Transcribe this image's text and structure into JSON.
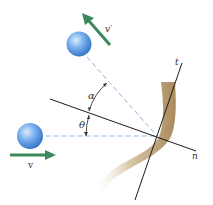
{
  "diagram": {
    "labels": {
      "incoming_velocity": "v",
      "outgoing_velocity": "v′",
      "normal_axis": "n",
      "tangent_axis": "t",
      "angle_rebound": "α",
      "angle_incidence": "θ"
    },
    "colors": {
      "ball_light": "#cfe4fa",
      "ball_mid": "#6aa6ea",
      "ball_dark": "#2f6fc4",
      "arrow": "#3a8a5c",
      "wall_light": "#f1e6d4",
      "wall_dark": "#a88a5c",
      "axis_line": "#1a1a1a",
      "dashed_line": "#8fb4dc",
      "label": "#333333"
    }
  }
}
